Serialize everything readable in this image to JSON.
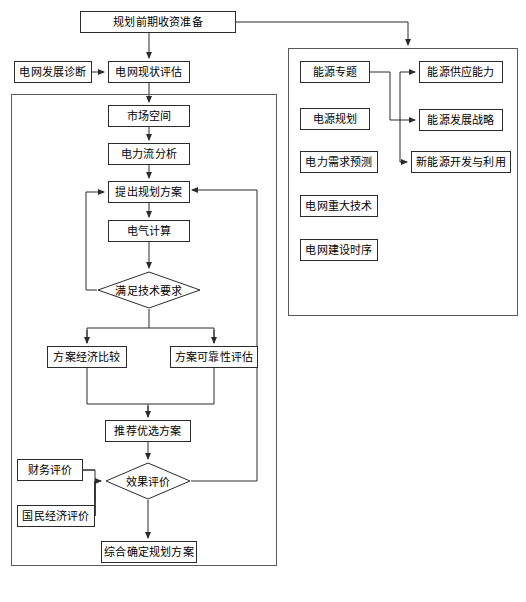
{
  "diagram": {
    "type": "flowchart",
    "stroke_color": "#2b2b2b",
    "container_color": "#5a5a5a",
    "background": "#ffffff"
  },
  "nodes": {
    "prep": {
      "label": "规划前期收资准备",
      "x": 80,
      "y": 11,
      "w": 156,
      "h": 22,
      "shape": "rect"
    },
    "diagnosis": {
      "label": "电网发展诊断",
      "x": 14,
      "y": 61,
      "w": 78,
      "h": 22,
      "shape": "rect"
    },
    "status_eval": {
      "label": "电网现状评估",
      "x": 108,
      "y": 61,
      "w": 82,
      "h": 22,
      "shape": "rect"
    },
    "market": {
      "label": "市场空间",
      "x": 108,
      "y": 105,
      "w": 82,
      "h": 22,
      "shape": "rect"
    },
    "power_flow": {
      "label": "电力流分析",
      "x": 108,
      "y": 143,
      "w": 82,
      "h": 22,
      "shape": "rect"
    },
    "propose": {
      "label": "提出规划方案",
      "x": 108,
      "y": 181,
      "w": 82,
      "h": 22,
      "shape": "rect"
    },
    "electrical_calc": {
      "label": "电气计算",
      "x": 108,
      "y": 220,
      "w": 82,
      "h": 22,
      "shape": "rect"
    },
    "tech_check": {
      "label": "满足技术要求",
      "x": 97,
      "y": 271,
      "w": 104,
      "h": 38,
      "shape": "diamond"
    },
    "econ_compare": {
      "label": "方案经济比较",
      "x": 47,
      "y": 346,
      "w": 80,
      "h": 22,
      "shape": "rect"
    },
    "reliability": {
      "label": "方案可靠性评估",
      "x": 170,
      "y": 346,
      "w": 88,
      "h": 22,
      "shape": "rect"
    },
    "recommend": {
      "label": "推荐优选方案",
      "x": 105,
      "y": 420,
      "w": 86,
      "h": 22,
      "shape": "rect"
    },
    "financial": {
      "label": "财务评价",
      "x": 17,
      "y": 459,
      "w": 66,
      "h": 22,
      "shape": "rect"
    },
    "national_econ": {
      "label": "国民经济评价",
      "x": 17,
      "y": 505,
      "w": 78,
      "h": 22,
      "shape": "rect"
    },
    "effect_eval": {
      "label": "效果评价",
      "x": 105,
      "y": 462,
      "w": 86,
      "h": 38,
      "shape": "diamond"
    },
    "final_plan": {
      "label": "综合确定规划方案",
      "x": 101,
      "y": 541,
      "w": 96,
      "h": 22,
      "shape": "rect"
    },
    "energy_topic": {
      "label": "能源专题",
      "x": 300,
      "y": 61,
      "w": 70,
      "h": 22,
      "shape": "rect"
    },
    "power_source_plan": {
      "label": "电源规划",
      "x": 300,
      "y": 108,
      "w": 70,
      "h": 22,
      "shape": "rect"
    },
    "demand_forecast": {
      "label": "电力需求预测",
      "x": 300,
      "y": 151,
      "w": 78,
      "h": 22,
      "shape": "rect"
    },
    "major_tech": {
      "label": "电网重大技术",
      "x": 300,
      "y": 195,
      "w": 78,
      "h": 22,
      "shape": "rect"
    },
    "build_schedule": {
      "label": "电网建设时序",
      "x": 300,
      "y": 239,
      "w": 78,
      "h": 22,
      "shape": "rect"
    },
    "supply_capacity": {
      "label": "能源供应能力",
      "x": 419,
      "y": 61,
      "w": 84,
      "h": 22,
      "shape": "rect"
    },
    "dev_strategy": {
      "label": "能源发展战略",
      "x": 419,
      "y": 109,
      "w": 84,
      "h": 22,
      "shape": "rect"
    },
    "new_energy": {
      "label": "新能源开发与利用",
      "x": 411,
      "y": 151,
      "w": 100,
      "h": 22,
      "shape": "rect"
    }
  },
  "containers": {
    "left_panel": {
      "name": "电网规划主流程框",
      "x": 11,
      "y": 94,
      "w": 266,
      "h": 472
    },
    "right_panel": {
      "name": "专题研究框",
      "x": 288,
      "y": 48,
      "w": 230,
      "h": 268
    }
  },
  "edges": [
    {
      "from": "prep",
      "to": "status_eval",
      "kind": "vertical-arrow"
    },
    {
      "from": "prep",
      "to": "right_panel",
      "kind": "elbow-arrow"
    },
    {
      "from": "diagnosis",
      "to": "status_eval",
      "kind": "horizontal-arrow"
    },
    {
      "from": "status_eval",
      "to": "market",
      "kind": "vertical-arrow"
    },
    {
      "from": "market",
      "to": "power_flow",
      "kind": "vertical-arrow"
    },
    {
      "from": "power_flow",
      "to": "propose",
      "kind": "vertical-arrow"
    },
    {
      "from": "propose",
      "to": "electrical_calc",
      "kind": "vertical-arrow"
    },
    {
      "from": "electrical_calc",
      "to": "tech_check",
      "kind": "vertical-arrow"
    },
    {
      "from": "tech_check",
      "to": "propose",
      "kind": "feedback-left"
    },
    {
      "from": "tech_check",
      "to": "econ_compare",
      "kind": "split-arrow"
    },
    {
      "from": "tech_check",
      "to": "reliability",
      "kind": "split-arrow"
    },
    {
      "from": "econ_compare",
      "to": "recommend",
      "kind": "merge-arrow"
    },
    {
      "from": "reliability",
      "to": "recommend",
      "kind": "merge-arrow"
    },
    {
      "from": "recommend",
      "to": "effect_eval",
      "kind": "vertical-arrow"
    },
    {
      "from": "financial",
      "to": "effect_eval",
      "kind": "elbow-arrow"
    },
    {
      "from": "national_econ",
      "to": "effect_eval",
      "kind": "elbow-arrow"
    },
    {
      "from": "effect_eval",
      "to": "propose",
      "kind": "feedback-right"
    },
    {
      "from": "effect_eval",
      "to": "final_plan",
      "kind": "vertical-arrow"
    },
    {
      "from": "energy_topic",
      "to": "supply_capacity",
      "kind": "bus-arrow"
    },
    {
      "from": "energy_topic",
      "to": "dev_strategy",
      "kind": "bus-arrow"
    },
    {
      "from": "energy_topic",
      "to": "new_energy",
      "kind": "bus-arrow"
    }
  ]
}
